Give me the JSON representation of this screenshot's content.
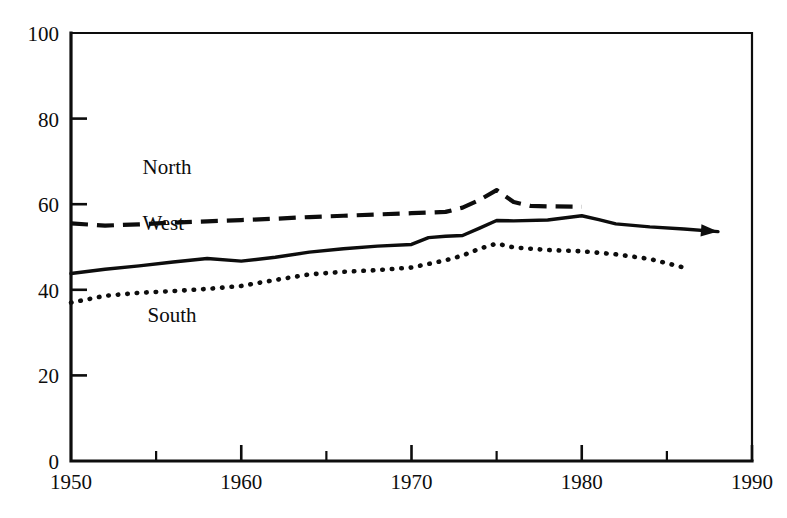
{
  "chart_data": {
    "type": "line",
    "title": "",
    "subtitle": "",
    "xlabel": "",
    "ylabel": "",
    "xlim": [
      1950,
      1990
    ],
    "ylim": [
      0,
      100
    ],
    "grid": false,
    "legend_position": "inline-labels",
    "x_ticks_major": [
      1960,
      1970,
      1980,
      1990
    ],
    "x_ticks_minor": [
      1955,
      1965,
      1975,
      1985
    ],
    "x_tick_labels": [
      "1950",
      "1960",
      "1970",
      "1980",
      "1990"
    ],
    "x_tick_label_values": [
      1950,
      1960,
      1970,
      1980,
      1990
    ],
    "y_ticks": [
      0,
      20,
      40,
      60,
      80,
      100
    ],
    "y_tick_labels": [
      "0",
      "20",
      "40",
      "60",
      "80",
      "100"
    ],
    "series": [
      {
        "name": "North",
        "style": "dashed",
        "label": "North",
        "x": [
          1950,
          1952,
          1954,
          1956,
          1958,
          1960,
          1962,
          1964,
          1966,
          1968,
          1970,
          1972,
          1973,
          1974,
          1975,
          1976,
          1977,
          1978,
          1980
        ],
        "values": [
          55.5,
          55.0,
          55.3,
          55.7,
          56.0,
          56.3,
          56.6,
          57.0,
          57.3,
          57.6,
          57.9,
          58.2,
          59.2,
          61.0,
          63.3,
          60.5,
          59.6,
          59.5,
          59.4
        ]
      },
      {
        "name": "West",
        "style": "solid",
        "label": "West",
        "x": [
          1950,
          1952,
          1954,
          1956,
          1958,
          1960,
          1962,
          1964,
          1966,
          1968,
          1970,
          1971,
          1972,
          1973,
          1974,
          1975,
          1976,
          1978,
          1980,
          1981,
          1982,
          1984,
          1986,
          1988
        ],
        "values": [
          43.8,
          44.8,
          45.6,
          46.5,
          47.3,
          46.7,
          47.6,
          48.8,
          49.6,
          50.2,
          50.6,
          52.2,
          52.5,
          52.7,
          54.4,
          56.2,
          56.1,
          56.3,
          57.3,
          56.4,
          55.4,
          54.7,
          54.2,
          53.6
        ]
      },
      {
        "name": "South",
        "style": "dotted",
        "label": "South",
        "x": [
          1950,
          1952,
          1954,
          1956,
          1958,
          1960,
          1962,
          1964,
          1966,
          1968,
          1970,
          1972,
          1973,
          1974,
          1975,
          1976,
          1978,
          1980,
          1982,
          1984,
          1986
        ],
        "values": [
          37.0,
          38.6,
          39.3,
          39.7,
          40.2,
          40.9,
          42.3,
          43.6,
          44.2,
          44.6,
          45.2,
          46.9,
          48.0,
          49.6,
          50.8,
          49.9,
          49.3,
          49.0,
          48.3,
          47.2,
          45.2
        ]
      }
    ],
    "annotations": [
      {
        "text": "North",
        "x": 1954.2,
        "y": 67.0
      },
      {
        "text": "West",
        "x": 1954.2,
        "y": 54.0
      },
      {
        "text": "South",
        "x": 1954.5,
        "y": 32.5
      }
    ],
    "colors": {
      "line": "#0d0d0d",
      "background": "#ffffff"
    }
  }
}
